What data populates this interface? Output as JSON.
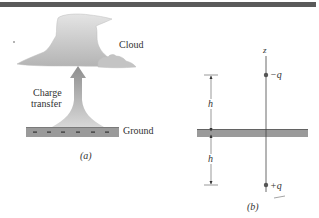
{
  "figure": {
    "top_rule_color": "#5a5a5a",
    "panel_a": {
      "caption": "(a)",
      "cloud_label": "Cloud",
      "arrow_label_line1": "Charge",
      "arrow_label_line2": "transfer",
      "ground_label": "Ground",
      "ground_charge_symbols": [
        "−",
        "−",
        "−",
        "−",
        "−",
        "−"
      ],
      "ground_color": "#9a9a9a",
      "cloud_color": "#c8c8c8",
      "arrow_color": "#a8a8a8"
    },
    "panel_b": {
      "caption": "(b)",
      "axis_label": "z",
      "top_charge_label": "−q",
      "bottom_charge_label": "+q",
      "upper_distance_label": "h",
      "lower_distance_label": "h",
      "ground_color": "#9a9a9a"
    }
  }
}
